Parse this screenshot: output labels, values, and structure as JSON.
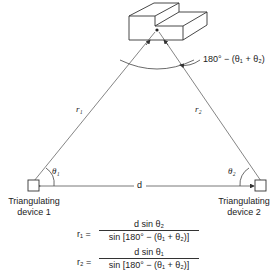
{
  "diagram": {
    "object_label": "target-object",
    "apex_angle_label": "180° − (θ₁ + θ₂)",
    "side_left_label": "r₁",
    "side_right_label": "r₂",
    "baseline_label": "d",
    "angle_left_label": "θ₁",
    "angle_right_label": "θ₂",
    "device_left": {
      "line1": "Triangulating",
      "line2": "device 1"
    },
    "device_right": {
      "line1": "Triangulating",
      "line2": "device 2"
    }
  },
  "equations": [
    {
      "lhs": "r₁ =",
      "numerator": "d sin θ₂",
      "denominator": "sin [180° − (θ₁ + θ₂)]"
    },
    {
      "lhs": "r₂ =",
      "numerator": "d sin θ₁",
      "denominator": "sin [180° − (θ₁ + θ₂)]"
    }
  ],
  "colors": {
    "line": "#555555",
    "text": "#222222",
    "background": "#ffffff"
  }
}
